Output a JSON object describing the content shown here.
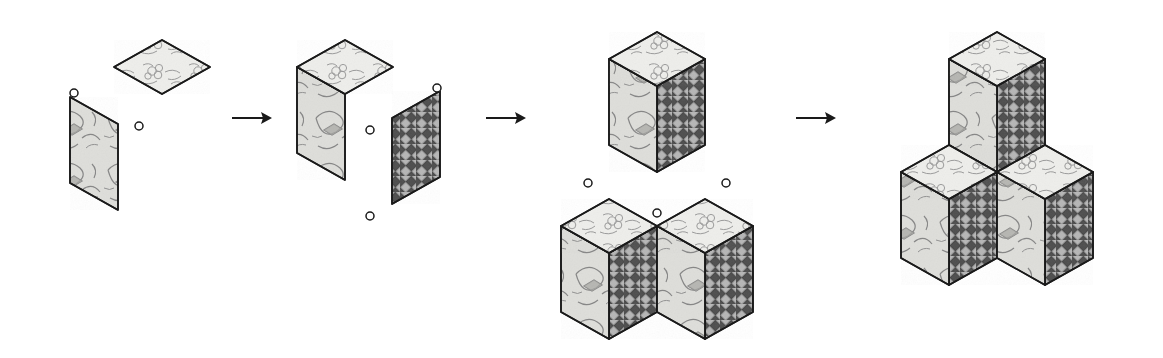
{
  "figure": {
    "background_color": "#ffffff",
    "ink_color": "#1a1a1a",
    "canvas": {
      "width": 1163,
      "height": 358
    },
    "step_count": 4,
    "arrow_count": 3
  },
  "materials": {
    "top_face": {
      "name": "floral-sketch-patch",
      "label": "Floral sketch patch (top face)",
      "fill": "#ededea",
      "line": "#8a8a8a",
      "description": "Light speckled ground with outlined flower and leaf sketch"
    },
    "left_face": {
      "name": "leaf-motif-patch",
      "label": "Leaf motif patch (left face)",
      "fill": "#dcdcd8",
      "line": "#7c7c7c",
      "description": "Mid-light ground with large leaf and diamond motif"
    },
    "right_face": {
      "name": "basket-weave-patch",
      "label": "Basket weave checkered patch (right face)",
      "fill": "#9a9a9a",
      "dark": "#4a4a4a",
      "light": "#c9c9c9",
      "description": "Dark and light diagonal woven checkerboard"
    }
  },
  "markers": {
    "name": "alignment-dot",
    "label": "Alignment dot",
    "glyph": "o",
    "radius": 4,
    "stroke": "#1a1a1a",
    "fill": "#ffffff",
    "count_per_step": [
      2,
      3,
      3,
      0
    ]
  },
  "arrows": [
    {
      "name": "arrow-step-1-to-2",
      "label": "→",
      "x1": 232,
      "x2": 272,
      "y": 118
    },
    {
      "name": "arrow-step-2-to-3",
      "label": "→",
      "x1": 486,
      "x2": 526,
      "y": 118
    },
    {
      "name": "arrow-step-3-to-4",
      "label": "→",
      "x1": 796,
      "x2": 836,
      "y": 118
    }
  ],
  "steps": [
    {
      "index": 1,
      "name": "step-separate-patches",
      "label": "Step 1 — two separate patches",
      "pieces": [
        "top_face",
        "left_face"
      ],
      "cubes": 0,
      "dots": 2
    },
    {
      "index": 2,
      "name": "step-two-faces-joined",
      "label": "Step 2 — top and left joined, weave patch pending",
      "pieces": [
        "top_face",
        "left_face",
        "right_face"
      ],
      "cubes": 0,
      "dots": 3
    },
    {
      "index": 3,
      "name": "step-three-cubes-apart",
      "label": "Step 3 — one cube above, two cubes below",
      "pieces": [
        "cube",
        "cube",
        "cube"
      ],
      "cubes": 3,
      "dots": 3
    },
    {
      "index": 4,
      "name": "step-assembled-cluster",
      "label": "Step 4 — three cubes merged into tumbling-block cluster",
      "pieces": [
        "cube",
        "cube",
        "cube"
      ],
      "cubes": 3,
      "dots": 0
    }
  ]
}
